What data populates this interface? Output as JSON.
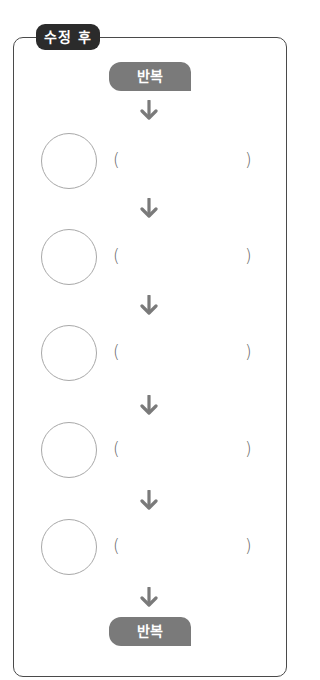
{
  "diagram": {
    "title": "수정 후",
    "start_label": "반복",
    "end_label": "반복",
    "steps": [
      {
        "circle_text": "",
        "blank_text": "",
        "open_paren": "(",
        "close_paren": ")"
      },
      {
        "circle_text": "",
        "blank_text": "",
        "open_paren": "(",
        "close_paren": ")"
      },
      {
        "circle_text": "",
        "blank_text": "",
        "open_paren": "(",
        "close_paren": ")"
      },
      {
        "circle_text": "",
        "blank_text": "",
        "open_paren": "(",
        "close_paren": ")"
      },
      {
        "circle_text": "",
        "blank_text": "",
        "open_paren": "(",
        "close_paren": ")"
      }
    ],
    "arrow_icon": "arrow-down-icon",
    "colors": {
      "title_bg": "#2b2b2b",
      "loop_badge_bg": "#7a7a7a",
      "arrow": "#7a7a7a",
      "frame_border": "#4a4a4a",
      "circle_border": "#a8a8a8"
    }
  }
}
